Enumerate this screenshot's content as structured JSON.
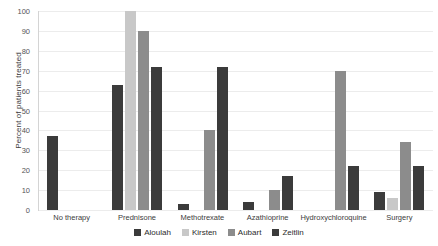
{
  "chart_data": {
    "type": "bar",
    "title": "",
    "xlabel": "",
    "ylabel": "Percent of patients treated",
    "ylim": [
      0,
      100
    ],
    "ytick_labels": [
      "100",
      "90",
      "80",
      "70",
      "60",
      "50",
      "40",
      "30",
      "20",
      "10",
      "0"
    ],
    "ytick_values": [
      100,
      90,
      80,
      70,
      60,
      50,
      40,
      30,
      20,
      10,
      0
    ],
    "grid": true,
    "legend_position": "bottom",
    "categories": [
      "No therapy",
      "Prednisone",
      "Methotrexate",
      "Azathioprine",
      "Hydroxychloroquine",
      "Surgery"
    ],
    "series": [
      {
        "name": "Aloulah",
        "color": "#3b3b3b",
        "values": [
          37,
          63,
          3,
          4,
          0,
          9
        ]
      },
      {
        "name": "Kirsten",
        "color": "#c8c8c8",
        "values": [
          0,
          100,
          0,
          0,
          0,
          6
        ]
      },
      {
        "name": "Aubart",
        "color": "#8c8c8c",
        "values": [
          0,
          90,
          40,
          10,
          70,
          34
        ]
      },
      {
        "name": "Zeitlin",
        "color": "#3b3b3b",
        "values": [
          0,
          72,
          72,
          17,
          22,
          22
        ]
      }
    ]
  },
  "legend": {
    "items": [
      {
        "label": "Aloulah"
      },
      {
        "label": "Kirsten"
      },
      {
        "label": "Aubart"
      },
      {
        "label": "Zeitlin"
      }
    ]
  }
}
